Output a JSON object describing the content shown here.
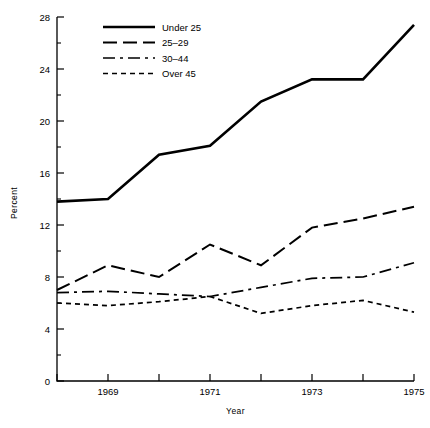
{
  "chart_data": {
    "type": "line",
    "title": "",
    "xlabel": "Year",
    "ylabel": "Percent",
    "x": [
      1968,
      1969,
      1970,
      1971,
      1972,
      1973,
      1974,
      1975
    ],
    "xlim": [
      1968,
      1975
    ],
    "ylim": [
      0,
      28
    ],
    "grid": false,
    "legend_position": "top-left-inside",
    "x_tick_labels": [
      "",
      "1969",
      "",
      "1971",
      "",
      "1973",
      "",
      "1975"
    ],
    "y_tick_labels": [
      "0",
      "4",
      "8",
      "12",
      "16",
      "20",
      "24",
      "28"
    ],
    "y_major_step": 4,
    "y_minor_step": 2,
    "series": [
      {
        "name": "Under 25",
        "style": "solid",
        "values": [
          13.8,
          14.0,
          17.4,
          18.1,
          21.5,
          23.2,
          23.2,
          27.4
        ]
      },
      {
        "name": "25–29",
        "style": "dashed",
        "values": [
          7.0,
          8.9,
          8.0,
          10.5,
          8.9,
          11.8,
          12.5,
          13.4
        ]
      },
      {
        "name": "30–44",
        "style": "dash-dot",
        "values": [
          6.8,
          6.9,
          6.7,
          6.5,
          7.2,
          7.9,
          8.0,
          9.1
        ]
      },
      {
        "name": "Over 45",
        "style": "dotted",
        "values": [
          6.0,
          5.8,
          6.1,
          6.5,
          5.2,
          5.8,
          6.2,
          5.3
        ]
      }
    ]
  },
  "axes": {
    "y_axis_title": "Percent",
    "x_axis_title": "Year"
  },
  "legend": {
    "entries": [
      {
        "label": "Under 25",
        "dash": "none"
      },
      {
        "label": "25–29",
        "dash": "14,6"
      },
      {
        "label": "30–44",
        "dash": "12,5,3,5"
      },
      {
        "label": "Over 45",
        "dash": "5,4"
      }
    ]
  },
  "colors": {
    "ink": "#000000",
    "background": "#ffffff"
  }
}
